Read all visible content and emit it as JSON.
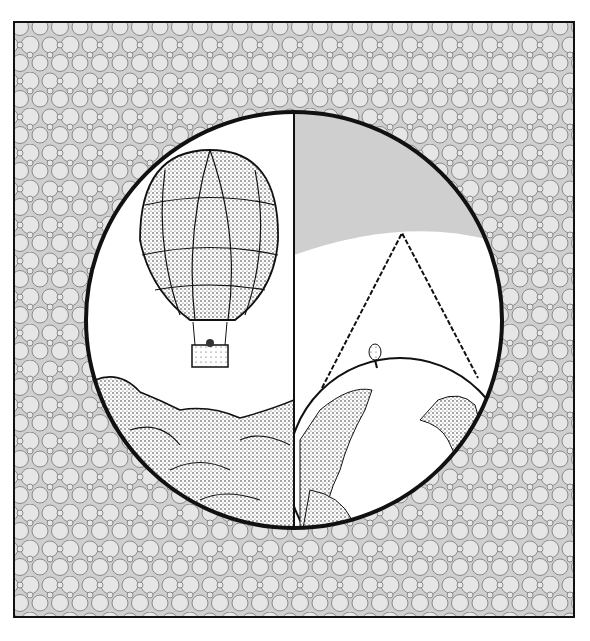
{
  "illustration": {
    "description": "Circular vignette split vertically: hot-air balloon above clouds on left; Earth with a high-altitude triangle geometry on right, on a circle-patterned background",
    "colors": {
      "background": "#ffffff",
      "pattern_fill": "#e4e4e4",
      "pattern_stroke": "#8a8a8a",
      "outline": "#111111",
      "sky_shade": "#cfcfcf"
    },
    "panels": [
      {
        "name": "left",
        "subject": "hot-air-balloon-over-clouds"
      },
      {
        "name": "right",
        "subject": "earth-with-triangle-and-small-balloon"
      }
    ]
  }
}
